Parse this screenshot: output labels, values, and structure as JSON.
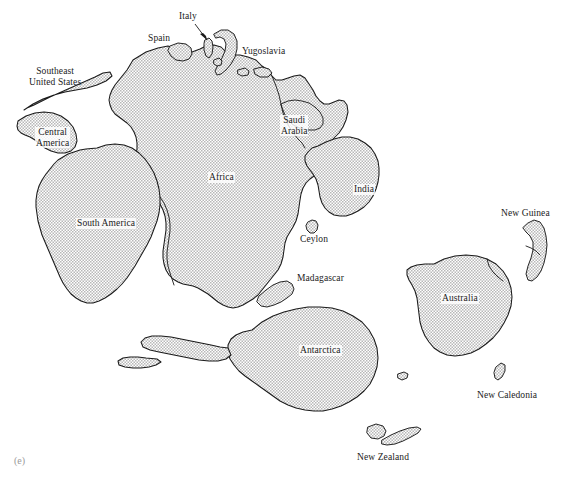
{
  "figure": {
    "caption": "(e)",
    "type": "paleogeographic-reconstruction",
    "colors": {
      "background": "#ffffff",
      "landmass_fill": "#d9d9d9",
      "landmass_stipple": "#8a8a8a",
      "coastline": "#1a1a1a",
      "label_text": "#1b1b1b",
      "caption_text": "#9a9a9a"
    }
  },
  "labels": [
    {
      "id": "italy",
      "text": "Italy",
      "line2": "",
      "x": 196,
      "y": 11,
      "halo": false,
      "leader": true
    },
    {
      "id": "spain",
      "text": "Spain",
      "line2": "",
      "x": 152,
      "y": 33,
      "halo": false,
      "leader": false
    },
    {
      "id": "yugoslavia",
      "text": "Yugoslavia",
      "line2": "",
      "x": 241,
      "y": 46,
      "halo": false,
      "leader": false
    },
    {
      "id": "southeast-united-states",
      "text": "Southeast",
      "line2": "United States",
      "x": 28,
      "y": 71,
      "halo": false,
      "leader": false
    },
    {
      "id": "saudi-arabia",
      "text": "Saudi",
      "line2": "Arabia",
      "x": 281,
      "y": 119,
      "halo": true,
      "leader": false
    },
    {
      "id": "central-america",
      "text": "Central",
      "line2": "America",
      "x": 36,
      "y": 131,
      "halo": true,
      "leader": false
    },
    {
      "id": "africa",
      "text": "Africa",
      "line2": "",
      "x": 209,
      "y": 173,
      "halo": true,
      "leader": false
    },
    {
      "id": "india",
      "text": "India",
      "line2": "",
      "x": 354,
      "y": 185,
      "halo": true,
      "leader": false
    },
    {
      "id": "south-america",
      "text": "South America",
      "line2": "",
      "x": 77,
      "y": 219,
      "halo": true,
      "leader": false
    },
    {
      "id": "new-guinea",
      "text": "New Guinea",
      "line2": "",
      "x": 503,
      "y": 210,
      "halo": false,
      "leader": false
    },
    {
      "id": "ceylon",
      "text": "Ceylon",
      "line2": "",
      "x": 300,
      "y": 235,
      "halo": true,
      "leader": false
    },
    {
      "id": "madagascar",
      "text": "Madagascar",
      "line2": "",
      "x": 298,
      "y": 274,
      "halo": true,
      "leader": false
    },
    {
      "id": "australia",
      "text": "Australia",
      "line2": "",
      "x": 442,
      "y": 294,
      "halo": true,
      "leader": false
    },
    {
      "id": "antarctica",
      "text": "Antarctica",
      "line2": "",
      "x": 300,
      "y": 346,
      "halo": true,
      "leader": false
    },
    {
      "id": "new-caledonia",
      "text": "New Caledonia",
      "line2": "",
      "x": 478,
      "y": 391,
      "halo": false,
      "leader": false
    },
    {
      "id": "new-zealand",
      "text": "New Zealand",
      "line2": "",
      "x": 357,
      "y": 453,
      "halo": false,
      "leader": false
    }
  ]
}
